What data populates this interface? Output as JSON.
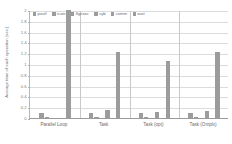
{
  "chart_data": {
    "type": "bar",
    "title": "",
    "xlabel": "",
    "ylabel": "Average time of each operation (sec.)",
    "ylim": [
      0,
      2
    ],
    "ytick_step": 0.2,
    "grid": true,
    "legend_position": "top-inside-left",
    "bar_color": "#9c9c9c",
    "categories": [
      "Parallel Loop",
      "Task",
      "Task (opt)",
      "Task (Omplx)"
    ],
    "yticks": [
      "0",
      "0.2",
      "0.4",
      "0.6",
      "0.8",
      "1",
      "1.2",
      "1.4",
      "1.6",
      "1.8",
      "2"
    ],
    "series": [
      {
        "name": "postf",
        "values": [
          0.1,
          0.1,
          0.1,
          0.1
        ]
      },
      {
        "name": "icum",
        "values": [
          0.01,
          0.02,
          0.02,
          0.02
        ]
      },
      {
        "name": "flgexec",
        "values": [
          0.0,
          0.0,
          0.0,
          0.0
        ]
      },
      {
        "name": "syb",
        "values": [
          0.0,
          0.14,
          0.11,
          0.13
        ]
      },
      {
        "name": "comm",
        "values": [
          0.0,
          0.0,
          0.0,
          0.0
        ]
      },
      {
        "name": "wait",
        "values": [
          2.0,
          1.22,
          1.05,
          1.22
        ]
      }
    ]
  },
  "legend": {
    "items": [
      {
        "label": "postf"
      },
      {
        "label": "icum"
      },
      {
        "label": "flgexec"
      },
      {
        "label": "syb"
      },
      {
        "label": "comm"
      },
      {
        "label": "wait"
      }
    ]
  }
}
